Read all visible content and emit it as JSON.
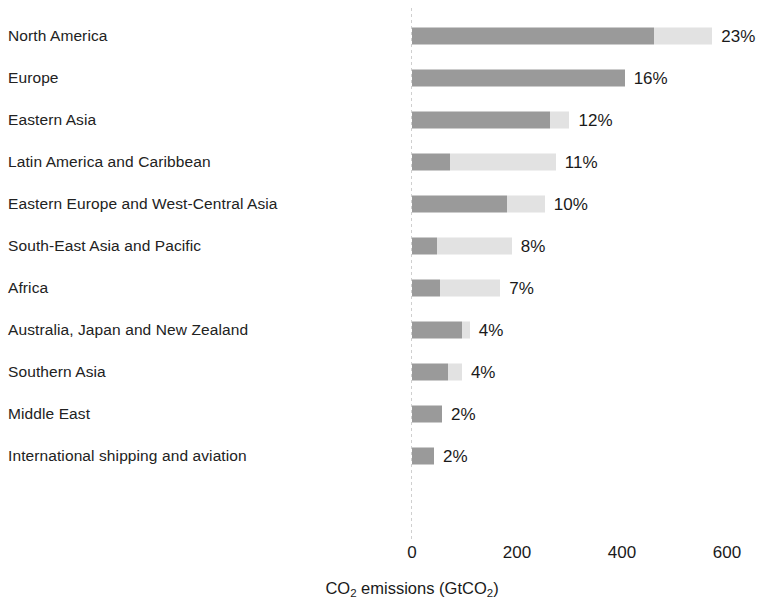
{
  "chart_data": {
    "type": "bar",
    "orientation": "horizontal",
    "stacked": true,
    "title": "",
    "xlabel": "CO2 emissions (GtCO2)",
    "xlabel_parts": {
      "pre": "CO",
      "sub1": "2",
      "mid": " emissions (GtCO",
      "sub2": "2",
      "post": ")"
    },
    "ylabel": "",
    "xlim": [
      0,
      620
    ],
    "xticks": [
      0,
      200,
      400,
      600
    ],
    "xtick_labels": [
      "0",
      "200",
      "400",
      "600"
    ],
    "grid": false,
    "legend": "none",
    "categories": [
      "North America",
      "Europe",
      "Eastern Asia",
      "Latin America and Caribbean",
      "Eastern Europe and West-Central Asia",
      "South-East Asia and Pacific",
      "Africa",
      "Australia, Japan and New Zealand",
      "Southern Asia",
      "Middle East",
      "International shipping and aviation"
    ],
    "series": [
      {
        "name": "segment-dark",
        "color": "#9a9a9a",
        "values": [
          460,
          405,
          262,
          72,
          181,
          48,
          53,
          95,
          68,
          57,
          42
        ]
      },
      {
        "name": "segment-light",
        "color": "#e2e2e2",
        "values": [
          112,
          0,
          38,
          202,
          72,
          142,
          115,
          15,
          27,
          0,
          0
        ]
      }
    ],
    "totals": [
      572,
      405,
      300,
      274,
      253,
      190,
      168,
      110,
      95,
      57,
      42
    ],
    "data_labels": [
      "23%",
      "16%",
      "12%",
      "11%",
      "10%",
      "8%",
      "7%",
      "4%",
      "4%",
      "2%",
      "2%"
    ]
  },
  "colors": {
    "segment_dark": "#9a9a9a",
    "segment_light": "#e2e2e2",
    "axis_line": "#cfcfcf",
    "text": "#1a1a1a",
    "background": "#ffffff"
  }
}
